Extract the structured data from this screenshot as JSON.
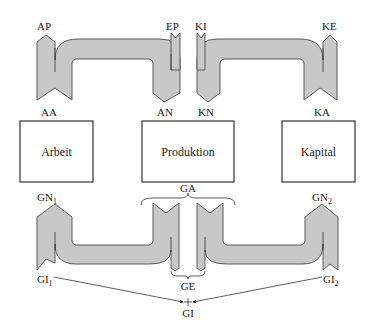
{
  "diagram": {
    "boxes": {
      "arbeit": "Arbeit",
      "produktion": "Produktion",
      "kapital": "Kapital"
    },
    "top_flows": {
      "labor_flow": {
        "in_label": "AP",
        "out_label": "AA",
        "end_in_label": "EP",
        "end_out_label": "AN"
      },
      "capital_flow": {
        "in_label": "KI",
        "out_label": "KN",
        "end_in_label": "KE",
        "end_out_label": "KA"
      }
    },
    "bottom_flows": {
      "left": {
        "top_label": "GN",
        "top_sub": "1",
        "bottom_label": "GI",
        "bottom_sub": "1"
      },
      "right": {
        "top_label": "GN",
        "top_sub": "2",
        "bottom_label": "GI",
        "bottom_sub": "2"
      },
      "center_top_label": "GA",
      "center_bottom_label": "GE",
      "sum_label": "GI"
    },
    "colors": {
      "flow_fill": "#c8c8c8",
      "stroke": "#4a4a4a"
    }
  }
}
